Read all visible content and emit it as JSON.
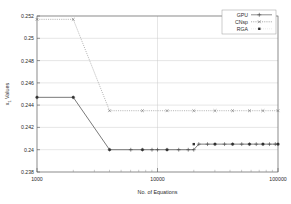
{
  "chart_data": {
    "type": "line",
    "title": "",
    "xlabel": "No. of Equations",
    "ylabel": "x₁ Values",
    "xscale": "log",
    "xlim": [
      1000,
      100000
    ],
    "ylim": [
      0.238,
      0.252
    ],
    "yticks": [
      "0.238",
      "0.24",
      "0.242",
      "0.244",
      "0.246",
      "0.248",
      "0.25",
      "0.252"
    ],
    "ytick_values": [
      0.238,
      0.24,
      0.242,
      0.244,
      0.246,
      0.248,
      0.25,
      0.252
    ],
    "xticks": [
      "1000",
      "10000",
      "100000"
    ],
    "xtick_values": [
      1000,
      10000,
      100000
    ],
    "grid": true,
    "legend_position": "top-right",
    "series": [
      {
        "name": "GPU",
        "marker": "plus",
        "linestyle": "solid",
        "color": "#404040",
        "x": [
          1000,
          2000,
          4000,
          6000,
          7500,
          9000,
          10000,
          12000,
          15000,
          18000,
          20000,
          22000,
          26000,
          30000,
          36000,
          42000,
          50000,
          58000,
          66000,
          75000,
          85000,
          95000,
          100000
        ],
        "y": [
          0.2447,
          0.2447,
          0.24,
          0.24,
          0.24,
          0.24,
          0.24,
          0.24,
          0.24,
          0.24,
          0.24,
          0.2405,
          0.2405,
          0.2405,
          0.2405,
          0.2405,
          0.2405,
          0.2405,
          0.2405,
          0.2405,
          0.2405,
          0.2405,
          0.2405
        ]
      },
      {
        "name": "CNsp",
        "marker": "cross",
        "linestyle": "dotted",
        "color": "#707070",
        "x": [
          1000,
          2000,
          4000,
          7500,
          12000,
          20000,
          30000,
          42000,
          58000,
          75000,
          100000
        ],
        "y": [
          0.2517,
          0.2517,
          0.2435,
          0.2435,
          0.2435,
          0.2435,
          0.2435,
          0.2435,
          0.2435,
          0.2435,
          0.2435
        ]
      },
      {
        "name": "RGA",
        "marker": "square",
        "linestyle": "none",
        "color": "#303030",
        "x": [
          1000,
          2000,
          4000,
          7500,
          12000,
          20000,
          30000,
          42000,
          58000,
          75000,
          100000
        ],
        "y": [
          0.2447,
          0.2447,
          0.24,
          0.24,
          0.24,
          0.2405,
          0.2405,
          0.2405,
          0.2405,
          0.2405,
          0.2405
        ]
      }
    ]
  },
  "legend": {
    "entries": [
      {
        "label": "GPU"
      },
      {
        "label": "CNsp"
      },
      {
        "label": "RGA"
      }
    ]
  },
  "axes": {
    "y_label": "x₁ Values",
    "y_label_base": "x",
    "y_label_sub": "1",
    "y_label_rest": " Values",
    "x_label": "No. of Equations"
  }
}
